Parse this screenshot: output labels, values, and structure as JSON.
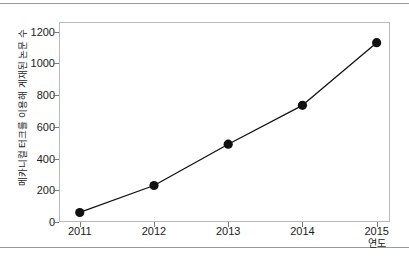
{
  "figure": {
    "rules": [
      "top-rule",
      "bottom-rule"
    ]
  },
  "chart_data": {
    "type": "line",
    "title": "",
    "xlabel": "연도",
    "ylabel": "메카니컬 터크를 이용해 게재된 논문 수",
    "categories": [
      "2011",
      "2012",
      "2013",
      "2014",
      "2015"
    ],
    "x": [
      2011,
      2012,
      2013,
      2014,
      2015
    ],
    "values": [
      60,
      230,
      490,
      735,
      1130
    ],
    "series": [
      {
        "name": "메카니컬 터크를 이용해 게재된 논문 수",
        "values": [
          60,
          230,
          490,
          735,
          1130
        ]
      }
    ],
    "ylim": [
      0,
      1260
    ],
    "xlim": [
      2010.72,
      2015.18
    ],
    "yticks": [
      0,
      200,
      400,
      600,
      800,
      1000,
      1200
    ],
    "ytick_labels": [
      "0",
      "200",
      "400",
      "600",
      "800",
      "1000",
      "1200"
    ],
    "xticks": [
      2011,
      2012,
      2013,
      2014,
      2015
    ],
    "xtick_labels": [
      "2011",
      "2012",
      "2013",
      "2014",
      "2015"
    ],
    "grid": false,
    "legend": false,
    "marker": "filled-circle",
    "marker_color": "#111111",
    "line_color": "#111111",
    "frame_color": "#b9b9b9"
  }
}
